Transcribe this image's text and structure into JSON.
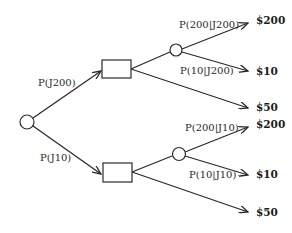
{
  "diagram": {
    "type": "decision-tree",
    "root": {
      "kind": "chance",
      "name": "root"
    },
    "branches": [
      {
        "label": "P(J200)",
        "decision": {
          "kind": "decision",
          "options": [
            {
              "kind": "chance",
              "outcomes": [
                {
                  "prob_label": "P(200|J200)",
                  "payoff": "$200"
                },
                {
                  "prob_label": "P(10|J200)",
                  "payoff": "$10"
                }
              ]
            },
            {
              "payoff": "$50"
            }
          ]
        }
      },
      {
        "label": "P(J10)",
        "decision": {
          "kind": "decision",
          "options": [
            {
              "kind": "chance",
              "outcomes": [
                {
                  "prob_label": "P(200|J10)",
                  "payoff": "$200"
                },
                {
                  "prob_label": "P(10|J10)",
                  "payoff": "$10"
                }
              ]
            },
            {
              "payoff": "$50"
            }
          ]
        }
      }
    ]
  },
  "labels": {
    "top_branch": "P(J200)",
    "bottom_branch": "P(J10)",
    "top_chance_hi": "P(200|J200)",
    "top_chance_lo": "P(10|J200)",
    "bottom_chance_hi": "P(200|J10)",
    "bottom_chance_lo": "P(10|J10)",
    "top_payoff_200": "$200",
    "top_payoff_10": "$10",
    "top_payoff_50": "$50",
    "bottom_payoff_200": "$200",
    "bottom_payoff_10": "$10",
    "bottom_payoff_50": "$50"
  },
  "colors": {
    "line": "#2a2a2a",
    "background": "#ffffff"
  }
}
